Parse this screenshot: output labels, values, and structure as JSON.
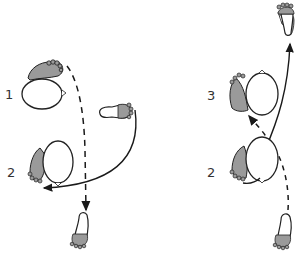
{
  "diagram": {
    "type": "step-diagram",
    "colors": {
      "foot_fill": "#9a9a9a",
      "line": "#1a1a1a",
      "background": "#ffffff"
    },
    "left_panel": {
      "labels": [
        {
          "id": "pos1",
          "text": "1"
        },
        {
          "id": "pos2",
          "text": "2"
        }
      ],
      "elements": [
        "body-position-1 (head circle + shaded foot)",
        "body-position-2 (head circle + shaded foot)",
        "outline footprint right (toes shaded)",
        "outline footprint bottom (toes shaded)",
        "dashed arrow downward",
        "solid curved arrow to the left"
      ]
    },
    "right_panel": {
      "labels": [
        {
          "id": "pos3",
          "text": "3"
        },
        {
          "id": "pos2b",
          "text": "2"
        }
      ],
      "elements": [
        "body-position-3 (head circle + shaded foot)",
        "body-position-2 (head circle + shaded foot)",
        "outline footprint top (toes shaded)",
        "outline footprint bottom (toes shaded)",
        "dashed arrow up-left",
        "solid arrow upward"
      ]
    }
  }
}
